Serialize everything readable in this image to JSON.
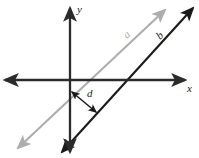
{
  "figure": {
    "width": 199,
    "height": 158,
    "background": "#ffffff"
  },
  "colors": {
    "axis": "#2b2b2b",
    "line_a": "#adadad",
    "line_b": "#1a1a1a",
    "distance_arrow": "#1a1a1a",
    "label_text": "#1a1a1a"
  },
  "axes": {
    "x_label": "x",
    "y_label": "y",
    "origin": {
      "x": 70,
      "y": 80
    },
    "x_axis": {
      "from": {
        "x": 5,
        "y": 80
      },
      "to": {
        "x": 185,
        "y": 80
      },
      "arrows": "both"
    },
    "y_axis": {
      "from": {
        "x": 70,
        "y": 152
      },
      "to": {
        "x": 70,
        "y": 8
      },
      "arrows": "both"
    }
  },
  "lines": [
    {
      "name": "line-a",
      "label": "a",
      "color": "#adadad",
      "label_position": {
        "x": 127,
        "y": 34
      },
      "from": {
        "x": 18,
        "y": 148
      },
      "to": {
        "x": 165,
        "y": 10
      },
      "arrows": "both",
      "x_intercept": {
        "x": 93,
        "y": 80
      }
    },
    {
      "name": "line-b",
      "label": "b",
      "color": "#1a1a1a",
      "label_position": {
        "x": 160,
        "y": 36
      },
      "from": {
        "x": 62,
        "y": 152
      },
      "to": {
        "x": 193,
        "y": 8
      },
      "arrows": "both",
      "x_intercept": {
        "x": 150,
        "y": 80
      }
    }
  ],
  "distance": {
    "label": "d",
    "label_position": {
      "x": 88,
      "y": 91
    },
    "color": "#1a1a1a",
    "from": {
      "x": 72,
      "y": 92
    },
    "to": {
      "x": 96,
      "y": 112
    },
    "arrows": "both",
    "description": "perpendicular distance between line a and line b"
  }
}
